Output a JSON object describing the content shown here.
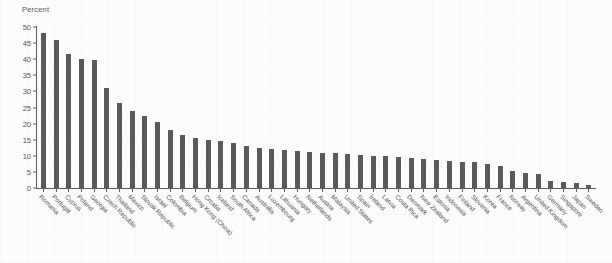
{
  "chart_data": {
    "type": "bar",
    "title": "",
    "subtitle": "",
    "xlabel": "",
    "ylabel": "Percent",
    "ylim": [
      0,
      50
    ],
    "yticks": [
      0,
      5,
      10,
      15,
      20,
      25,
      30,
      35,
      40,
      45,
      50
    ],
    "grid": false,
    "legend": null,
    "bar_color": "#5a5a5a",
    "axis_color": "#5d5d5d",
    "background_color": "#fcfcfc",
    "categories": [
      "Romania",
      "Portugal",
      "Cyprus",
      "Poland",
      "Georgia",
      "Czech Republic",
      "Thailand",
      "Mexico",
      "Slovak Republic",
      "Israel",
      "Colombia",
      "Belgium",
      "Hong Kong (China)",
      "Croatia",
      "Iceland",
      "South Africa",
      "Canada",
      "Australia",
      "Luxembourg",
      "Lithuania",
      "Hungary",
      "Netherlands",
      "Austria",
      "Malaysia",
      "United States",
      "Spain",
      "Ireland",
      "Latvia",
      "Costa Rica",
      "Denmark",
      "New Zealand",
      "Estonia",
      "Indonesia",
      "Finland",
      "Slovenia",
      "Korea",
      "France",
      "Norway",
      "Argentina",
      "United Kingdom",
      "Germany",
      "Singapore",
      "Japan",
      "Sweden"
    ],
    "values": [
      48.0,
      46.0,
      41.5,
      40.0,
      39.7,
      31.2,
      26.5,
      24.0,
      22.5,
      20.5,
      18.0,
      16.5,
      15.5,
      14.8,
      14.5,
      14.0,
      13.0,
      12.3,
      12.0,
      11.8,
      11.5,
      11.2,
      11.0,
      10.8,
      10.5,
      10.2,
      10.0,
      9.8,
      9.5,
      9.2,
      9.0,
      8.8,
      8.5,
      8.2,
      8.0,
      7.5,
      6.8,
      5.2,
      4.8,
      4.5,
      2.2,
      1.8,
      1.5,
      0.8
    ]
  }
}
